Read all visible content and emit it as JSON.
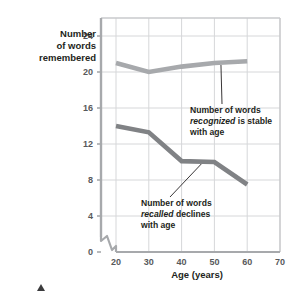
{
  "chart_data": {
    "type": "line",
    "title": "",
    "subtitle": "",
    "xlabel": "Age (years)",
    "ylabel": "Number of words remembered",
    "ylabel_lines": [
      "Number",
      "of words",
      "remembered"
    ],
    "x": [
      20,
      30,
      40,
      50,
      60
    ],
    "xticks": [
      "20",
      "30",
      "40",
      "50",
      "60",
      "70"
    ],
    "xtick_values": [
      20,
      30,
      40,
      50,
      60,
      70
    ],
    "yticks": [
      "0",
      "4",
      "8",
      "12",
      "16",
      "20",
      "24"
    ],
    "ytick_values": [
      0,
      4,
      8,
      12,
      16,
      20,
      24
    ],
    "xlim": [
      20,
      70
    ],
    "ylim": [
      0,
      26
    ],
    "grid": true,
    "legend_position": "none",
    "y_axis_break": true,
    "series": [
      {
        "name": "Number of words recognized",
        "color": "#a7a9ac",
        "values": [
          21.0,
          20.0,
          20.6,
          21.0,
          21.2
        ]
      },
      {
        "name": "Number of words recalled",
        "color": "#808285",
        "values": [
          14.0,
          13.3,
          10.1,
          10.0,
          7.5
        ]
      }
    ],
    "annotations": [
      {
        "id": "recognized-note",
        "lines": [
          {
            "pre": "Number of words",
            "italic": "",
            "post": ""
          },
          {
            "pre": "",
            "italic": "recognized",
            "post": " is stable"
          },
          {
            "pre": "with age",
            "italic": "",
            "post": ""
          }
        ],
        "text": "Number of words recognized is stable with age",
        "points_to_x": 52,
        "points_to_y": 21.0
      },
      {
        "id": "recalled-note",
        "lines": [
          {
            "pre": "Number of words",
            "italic": "",
            "post": ""
          },
          {
            "pre": "",
            "italic": "recalled",
            "post": " declines"
          },
          {
            "pre": "with age",
            "italic": "",
            "post": ""
          }
        ],
        "text": "Number of words recalled declines with age",
        "points_to_x": 46,
        "points_to_y": 10.0
      }
    ]
  },
  "marks": {
    "corner_triangle": "triangle-marker"
  }
}
